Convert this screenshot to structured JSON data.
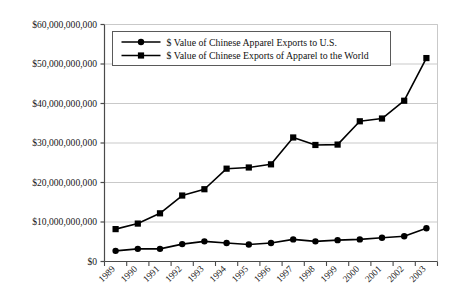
{
  "chart_data": {
    "type": "line",
    "title": "",
    "subtitle": "",
    "xlabel": "",
    "ylabel": "",
    "grid": true,
    "grid_axis": "y",
    "legend_position": "top-left-inside",
    "x": [
      "1989",
      "1990",
      "1991",
      "1992",
      "1993",
      "1994",
      "1995",
      "1996",
      "1997",
      "1998",
      "1999",
      "2000",
      "2001",
      "2002",
      "2003"
    ],
    "categories": [
      "1989",
      "1990",
      "1991",
      "1992",
      "1993",
      "1994",
      "1995",
      "1996",
      "1997",
      "1998",
      "1999",
      "2000",
      "2001",
      "2002",
      "2003"
    ],
    "ylim": [
      0,
      60000000000
    ],
    "ytick_values": [
      0,
      10000000000,
      20000000000,
      30000000000,
      40000000000,
      50000000000,
      60000000000
    ],
    "ytick_labels": [
      "$0",
      "$10,000,000,000",
      "$20,000,000,000",
      "$30,000,000,000",
      "$40,000,000,000",
      "$50,000,000,000",
      "$60,000,000,000"
    ],
    "series": [
      {
        "name": "$ Value of Chinese Apparel Exports to U.S.",
        "marker": "circle",
        "color": "#000000",
        "values": [
          2700000000,
          3200000000,
          3200000000,
          4400000000,
          5100000000,
          4700000000,
          4300000000,
          4700000000,
          5600000000,
          5100000000,
          5400000000,
          5600000000,
          6000000000,
          6400000000,
          8400000000
        ]
      },
      {
        "name": "$ Value of Chinese Exports of Apparel to the World",
        "marker": "square",
        "color": "#000000",
        "values": [
          8200000000,
          9600000000,
          12200000000,
          16700000000,
          18300000000,
          23500000000,
          23800000000,
          24600000000,
          31400000000,
          29500000000,
          29600000000,
          35500000000,
          36200000000,
          40700000000,
          51500000000
        ]
      }
    ]
  },
  "legend": {
    "entries": [
      {
        "label": "$ Value of Chinese Apparel Exports to U.S.",
        "marker": "circle"
      },
      {
        "label": "$ Value of Chinese Exports of Apparel to the World",
        "marker": "square"
      }
    ]
  },
  "colors": {
    "axis": "#4a4a4a",
    "grid": "#c9c9c9",
    "series": "#000000",
    "legend_border": "#5a5a5a",
    "text": "#111111",
    "background": "#ffffff"
  }
}
